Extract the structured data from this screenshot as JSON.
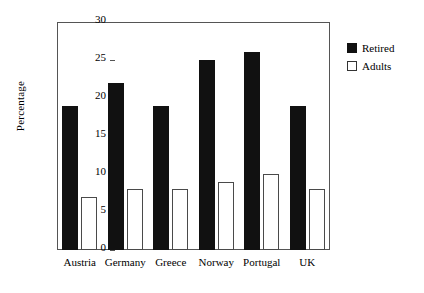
{
  "chart_data": {
    "type": "bar",
    "title": "",
    "xlabel": "",
    "ylabel": "Percentage",
    "categories": [
      "Austria",
      "Germany",
      "Greece",
      "Norway",
      "Portugal",
      "UK"
    ],
    "series": [
      {
        "name": "Retired",
        "values": [
          19,
          22,
          19,
          25,
          26,
          19
        ],
        "color": "#111111"
      },
      {
        "name": "Adults",
        "values": [
          7,
          8,
          8,
          9,
          10,
          8
        ],
        "color": "#ffffff"
      }
    ],
    "ylim": [
      0,
      30
    ],
    "yticks": [
      0,
      5,
      10,
      15,
      20,
      25,
      30
    ],
    "ytick_labels": [
      "0",
      "5",
      "10",
      "15",
      "20",
      "25",
      "30"
    ],
    "grid": false,
    "legend_position": "outside-top-right",
    "frame": true
  },
  "legend": {
    "entries": [
      {
        "label": "Retired",
        "swatch": "filled-black-square"
      },
      {
        "label": "Adults",
        "swatch": "open-white-square"
      }
    ]
  }
}
